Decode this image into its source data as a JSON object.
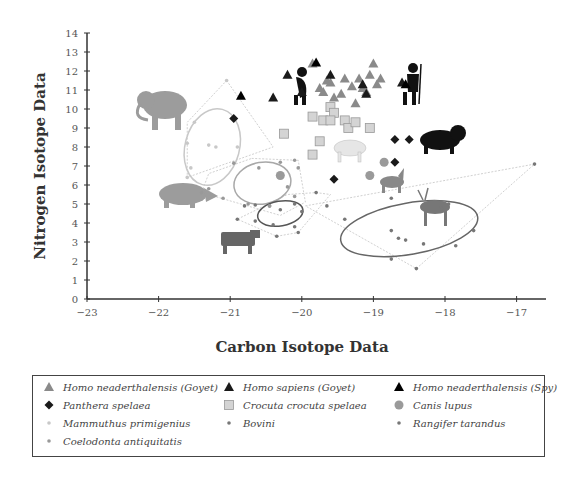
{
  "chart_data": {
    "type": "scatter",
    "title": "",
    "xlabel": "Carbon Isotope Data",
    "ylabel": "Nitrogen Isotope Data",
    "xlim": [
      -23,
      -16.6
    ],
    "ylim": [
      0,
      14
    ],
    "xticks": [
      "-23",
      "-22",
      "-21",
      "-20",
      "-19",
      "-18",
      "-17"
    ],
    "yticks": [
      "0",
      "1",
      "2",
      "3",
      "4",
      "5",
      "6",
      "7",
      "8",
      "9",
      "10",
      "11",
      "12",
      "13",
      "14"
    ],
    "grid": false,
    "legend_position": "bottom",
    "series": [
      {
        "name": "Homo neaderthalensis (Goyet)",
        "marker": "triangle",
        "color": "#8a8a8a",
        "points": [
          [
            -19.85,
            12.4
          ],
          [
            -19.2,
            11.6
          ],
          [
            -19.6,
            11.4
          ],
          [
            -19.4,
            11.6
          ],
          [
            -19.3,
            11.2
          ],
          [
            -19.15,
            11.1
          ],
          [
            -19.05,
            11.8
          ],
          [
            -19.0,
            12.4
          ],
          [
            -18.95,
            11.3
          ],
          [
            -19.1,
            10.9
          ],
          [
            -19.45,
            10.8
          ],
          [
            -19.7,
            10.9
          ],
          [
            -19.75,
            11.1
          ],
          [
            -19.55,
            10.6
          ],
          [
            -19.25,
            10.3
          ],
          [
            -18.9,
            11.6
          ],
          [
            -19.65,
            11.5
          ]
        ]
      },
      {
        "name": "Homo sapiens (Goyet)",
        "marker": "triangle",
        "color": "#1a1a1a",
        "points": [
          [
            -20.2,
            11.8
          ],
          [
            -19.6,
            11.8
          ],
          [
            -19.15,
            11.3
          ],
          [
            -18.6,
            11.4
          ],
          [
            -19.1,
            10.8
          ],
          [
            -20.0,
            10.9
          ],
          [
            -20.4,
            10.6
          ]
        ]
      },
      {
        "name": "Homo neaderthalensis (Spy)",
        "marker": "triangle",
        "color": "#000000",
        "points": [
          [
            -20.85,
            10.7
          ],
          [
            -19.8,
            12.45
          ],
          [
            -18.55,
            11.3
          ]
        ]
      },
      {
        "name": "Panthera spelaea",
        "marker": "diamond",
        "color": "#1a1a1a",
        "points": [
          [
            -20.95,
            9.5
          ],
          [
            -18.7,
            8.4
          ],
          [
            -18.5,
            8.4
          ],
          [
            -18.7,
            7.2
          ],
          [
            -19.55,
            6.3
          ]
        ]
      },
      {
        "name": "Crocuta crocuta spelaea",
        "marker": "square",
        "color": "#d4d4d4",
        "points": [
          [
            -20.25,
            8.7
          ],
          [
            -19.85,
            7.6
          ],
          [
            -19.85,
            9.6
          ],
          [
            -19.7,
            9.4
          ],
          [
            -19.6,
            10.1
          ],
          [
            -19.55,
            9.8
          ],
          [
            -19.4,
            9.4
          ],
          [
            -19.35,
            9.0
          ],
          [
            -19.25,
            9.3
          ],
          [
            -19.05,
            9.0
          ],
          [
            -19.6,
            9.4
          ],
          [
            -19.75,
            8.3
          ]
        ]
      },
      {
        "name": "Canis lupus",
        "marker": "circle",
        "color": "#9a9a9a",
        "points": [
          [
            -20.3,
            6.5
          ],
          [
            -18.85,
            7.2
          ],
          [
            -19.05,
            6.5
          ]
        ]
      },
      {
        "name": "Mammuthus primigenius",
        "marker": "dot",
        "color": "#c8c8c8",
        "points": [
          [
            -21.05,
            11.5
          ],
          [
            -21.5,
            9.3
          ],
          [
            -21.6,
            8.2
          ],
          [
            -21.3,
            8.1
          ],
          [
            -20.9,
            8.0
          ],
          [
            -21.55,
            6.9
          ],
          [
            -21.6,
            6.4
          ],
          [
            -21.2,
            8.0
          ]
        ]
      },
      {
        "name": "Bovini",
        "marker": "dot",
        "color": "#777777",
        "points": [
          [
            -20.65,
            4.95
          ],
          [
            -20.45,
            4.9
          ],
          [
            -20.3,
            4.7
          ],
          [
            -20.1,
            5.0
          ],
          [
            -20.0,
            4.6
          ],
          [
            -20.8,
            4.9
          ],
          [
            -20.9,
            4.2
          ],
          [
            -20.65,
            4.1
          ],
          [
            -20.4,
            3.9
          ],
          [
            -20.1,
            3.8
          ],
          [
            -20.05,
            3.5
          ],
          [
            -20.35,
            3.3
          ],
          [
            -19.8,
            5.6
          ],
          [
            -19.65,
            4.9
          ],
          [
            -19.4,
            4.2
          ]
        ]
      },
      {
        "name": "Rangifer tarandus",
        "marker": "dot",
        "color": "#777777",
        "points": [
          [
            -16.75,
            7.1
          ],
          [
            -17.6,
            3.6
          ],
          [
            -18.4,
            1.6
          ],
          [
            -18.75,
            5.3
          ],
          [
            -17.95,
            5.0
          ],
          [
            -18.75,
            3.6
          ],
          [
            -18.65,
            3.2
          ],
          [
            -18.55,
            3.1
          ],
          [
            -18.3,
            2.9
          ],
          [
            -18.75,
            2.1
          ],
          [
            -17.85,
            2.8
          ],
          [
            -18.05,
            4.8
          ]
        ]
      },
      {
        "name": "Coelodonta antiquitatis",
        "marker": "dot",
        "color": "#999999",
        "points": [
          [
            -20.1,
            7.3
          ],
          [
            -20.95,
            7.15
          ],
          [
            -21.3,
            5.8
          ],
          [
            -21.4,
            5.6
          ],
          [
            -21.1,
            5.3
          ],
          [
            -20.75,
            5.0
          ],
          [
            -20.45,
            4.9
          ],
          [
            -20.1,
            5.4
          ],
          [
            -20.2,
            5.9
          ],
          [
            -20.05,
            6.9
          ],
          [
            -20.3,
            7.2
          ],
          [
            -20.6,
            6.9
          ]
        ]
      }
    ],
    "ellipses": [
      {
        "group": "Mammuthus primigenius",
        "center": [
          -21.25,
          8.0
        ],
        "rx_data": 0.38,
        "ry_data": 2.05,
        "rotate_deg": 15,
        "color": "#c8c8c8"
      },
      {
        "group": "Coelodonta antiquitatis",
        "center": [
          -20.55,
          6.1
        ],
        "rx_data": 0.4,
        "ry_data": 1.1,
        "rotate_deg": -10,
        "color": "#a8a8a8"
      },
      {
        "group": "Bovini",
        "center": [
          -20.3,
          4.5
        ],
        "rx_data": 0.32,
        "ry_data": 0.65,
        "rotate_deg": -10,
        "color": "#555555"
      },
      {
        "group": "Rangifer tarandus",
        "center": [
          -18.5,
          3.7
        ],
        "rx_data": 0.97,
        "ry_data": 1.35,
        "rotate_deg": -10,
        "color": "#666666"
      }
    ],
    "hulls": [
      {
        "group": "Mammuthus primigenius",
        "points": [
          [
            -21.05,
            11.5
          ],
          [
            -20.4,
            8.0
          ],
          [
            -21.6,
            6.4
          ],
          [
            -21.6,
            9.3
          ]
        ]
      },
      {
        "group": "Coelodonta antiquitatis",
        "points": [
          [
            -20.7,
            7.4
          ],
          [
            -20.05,
            7.3
          ],
          [
            -19.95,
            5.1
          ],
          [
            -20.3,
            4.4
          ],
          [
            -21.4,
            5.6
          ],
          [
            -21.3,
            6.6
          ]
        ]
      },
      {
        "group": "Bovini",
        "points": [
          [
            -19.8,
            5.6
          ],
          [
            -19.6,
            5.5
          ],
          [
            -20.05,
            3.5
          ],
          [
            -20.35,
            3.3
          ],
          [
            -20.9,
            4.2
          ],
          [
            -20.2,
            5.5
          ]
        ]
      },
      {
        "group": "Rangifer tarandus",
        "points": [
          [
            -19.95,
            4.9
          ],
          [
            -16.75,
            7.1
          ],
          [
            -18.4,
            1.6
          ]
        ]
      }
    ],
    "illustrations": [
      "mammoth",
      "woolly-rhinoceros",
      "bovine",
      "neanderthal-figure",
      "human-with-spear",
      "hyena",
      "cave-lion",
      "wolf",
      "reindeer"
    ]
  },
  "legend": {
    "items": [
      {
        "label": "Homo neaderthalensis (Goyet)",
        "symbol": "triangle",
        "color": "#8a8a8a"
      },
      {
        "label": "Homo sapiens (Goyet)",
        "symbol": "triangle",
        "color": "#1a1a1a"
      },
      {
        "label": "Homo neaderthalensis (Spy)",
        "symbol": "triangle",
        "color": "#000000"
      },
      {
        "label": "Panthera spelaea",
        "symbol": "diamond",
        "color": "#1a1a1a"
      },
      {
        "label": "Crocuta crocuta spelaea",
        "symbol": "square",
        "color": "#d4d4d4"
      },
      {
        "label": "Canis lupus",
        "symbol": "circle",
        "color": "#9a9a9a"
      },
      {
        "label": "Mammuthus primigenius",
        "symbol": "dot",
        "color": "#c8c8c8"
      },
      {
        "label": "Bovini",
        "symbol": "dot",
        "color": "#777777"
      },
      {
        "label": "Rangifer tarandus",
        "symbol": "dot",
        "color": "#777777"
      },
      {
        "label": "Coelodonta antiquitatis",
        "symbol": "dot",
        "color": "#999999"
      }
    ]
  }
}
